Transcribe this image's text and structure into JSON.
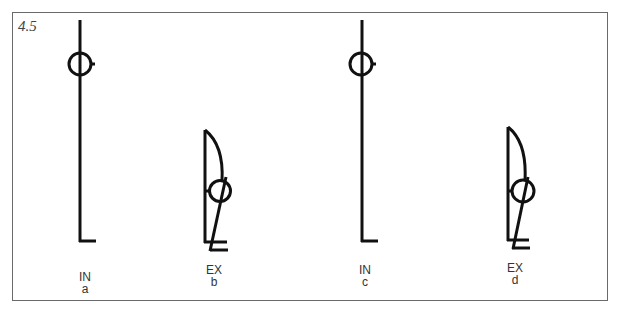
{
  "figure_number": "4.5",
  "figures": [
    {
      "id": "a",
      "mode": "IN",
      "letter": "a"
    },
    {
      "id": "b",
      "mode": "EX",
      "letter": "b"
    },
    {
      "id": "c",
      "mode": "IN",
      "letter": "c"
    },
    {
      "id": "d",
      "mode": "EX",
      "letter": "d"
    }
  ],
  "colors": {
    "stroke": "#111111",
    "frame": "#6a6a6a"
  }
}
